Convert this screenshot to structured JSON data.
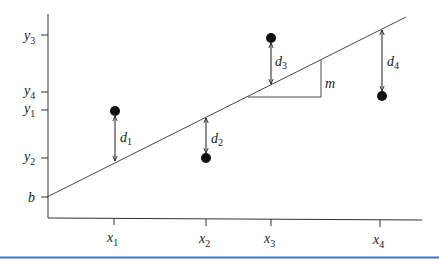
{
  "diagram": {
    "intercept_label": "b",
    "slope_label": "m",
    "x_ticks": [
      {
        "name": "x",
        "sub": "1",
        "px": 114
      },
      {
        "name": "x",
        "sub": "2",
        "px": 206
      },
      {
        "name": "x",
        "sub": "3",
        "px": 271
      },
      {
        "name": "x",
        "sub": "4",
        "px": 380
      }
    ],
    "y_ticks": [
      {
        "name": "y",
        "sub": "3",
        "py": 35
      },
      {
        "name": "y",
        "sub": "4",
        "py": 92
      },
      {
        "name": "y",
        "sub": "1",
        "py": 110
      },
      {
        "name": "y",
        "sub": "2",
        "py": 158
      }
    ],
    "points": [
      {
        "label": "(x1, y1)",
        "px": 115,
        "py": 111,
        "line_py": 162,
        "deviation": "d",
        "dev_sub": "1"
      },
      {
        "label": "(x2, y2)",
        "px": 206,
        "py": 158,
        "line_py": 117,
        "deviation": "d",
        "dev_sub": "2"
      },
      {
        "label": "(x3, y3)",
        "px": 271,
        "py": 38,
        "line_py": 85,
        "deviation": "d",
        "dev_sub": "3"
      },
      {
        "label": "(x4, y4)",
        "px": 382,
        "py": 96,
        "line_py": 29,
        "deviation": "d",
        "dev_sub": "4"
      }
    ],
    "line": {
      "x1": 47,
      "y1": 197,
      "x2": 406,
      "y2": 17
    },
    "colors": {
      "ink": "#1a1a1a",
      "rule": "#3a78c2"
    }
  }
}
